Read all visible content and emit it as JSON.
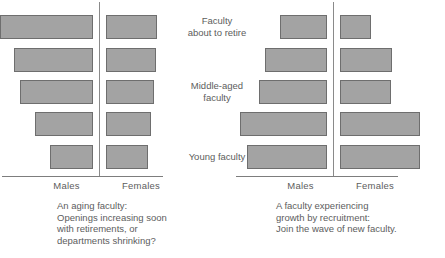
{
  "figure": {
    "background": "#ffffff",
    "bar_fill": "#a3a3a3",
    "bar_stroke": "#6e6e6e",
    "text_color": "#5d5d5d"
  },
  "category_labels": [
    {
      "text": "Faculty\nabout to retire",
      "row": 0
    },
    {
      "text": "Middle-aged\nfaculty",
      "row": 2
    },
    {
      "text": "Young faculty",
      "row": 4
    }
  ],
  "charts": [
    {
      "id": "aging-faculty",
      "axis_labels": {
        "left": "Males",
        "right": "Females"
      },
      "caption": "An aging faculty:\nOpenings increasing soon\nwith retirements, or\ndepartments shrinking?",
      "rows": [
        {
          "label": "Faculty about to retire",
          "males": 93,
          "females": 51
        },
        {
          "label": "Older faculty",
          "males": 79,
          "females": 50
        },
        {
          "label": "Middle-aged faculty",
          "males": 73,
          "females": 48
        },
        {
          "label": "Younger mid faculty",
          "males": 58,
          "females": 45
        },
        {
          "label": "Young faculty",
          "males": 43,
          "females": 42
        }
      ]
    },
    {
      "id": "growing-faculty",
      "axis_labels": {
        "left": "Males",
        "right": "Females"
      },
      "caption": "A faculty experiencing\ngrowth by recruitment:\nJoin the wave of new faculty.",
      "rows": [
        {
          "label": "Faculty about to retire",
          "males": 47,
          "females": 31
        },
        {
          "label": "Older faculty",
          "males": 62,
          "females": 52
        },
        {
          "label": "Middle-aged faculty",
          "males": 68,
          "females": 51
        },
        {
          "label": "Younger mid faculty",
          "males": 87,
          "females": 80
        },
        {
          "label": "Young faculty",
          "males": 80,
          "females": 80
        }
      ]
    }
  ],
  "chart_data": {
    "type": "bar",
    "subtype": "population-pyramid",
    "title": "",
    "xlabel": "Number of faculty",
    "ylabel": "Age group",
    "grid": false,
    "legend": "none",
    "categories": [
      "Faculty about to retire",
      "Older faculty",
      "Middle-aged faculty",
      "Younger mid faculty",
      "Young faculty"
    ],
    "panels": [
      {
        "name": "An aging faculty",
        "series": [
          {
            "name": "Males",
            "direction": "left",
            "values": [
              93,
              79,
              73,
              58,
              43
            ]
          },
          {
            "name": "Females",
            "direction": "right",
            "values": [
              51,
              50,
              48,
              45,
              42
            ]
          }
        ]
      },
      {
        "name": "A faculty experiencing growth by recruitment",
        "series": [
          {
            "name": "Males",
            "direction": "left",
            "values": [
              47,
              62,
              68,
              87,
              80
            ]
          },
          {
            "name": "Females",
            "direction": "right",
            "values": [
              31,
              52,
              51,
              80,
              80
            ]
          }
        ]
      }
    ],
    "xlim": [
      0,
      100
    ],
    "units": "relative bar length (px)"
  }
}
